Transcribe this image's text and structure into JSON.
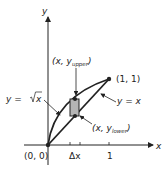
{
  "diagram": {
    "type": "area-between-curves",
    "axes": {
      "x_label": "x",
      "y_label": "y"
    },
    "origin_label": "(0, 0)",
    "end_point_label": "(1, 1)",
    "tick_labels": {
      "delta_x": "Δx",
      "one": "1"
    },
    "curves": [
      {
        "name": "sqrt",
        "label_lhs": "y = ",
        "label_rhs": "x",
        "description": "y = √x"
      },
      {
        "name": "linear",
        "label": "y = x"
      }
    ],
    "rectangle_points": {
      "upper": {
        "prefix": "(x, y",
        "sub": "upper",
        "suffix": ")"
      },
      "lower": {
        "prefix": "(x, y",
        "sub": "lower",
        "suffix": ")"
      }
    },
    "colors": {
      "stroke": "#222222",
      "rect_fill": "#b5b5b5"
    }
  }
}
